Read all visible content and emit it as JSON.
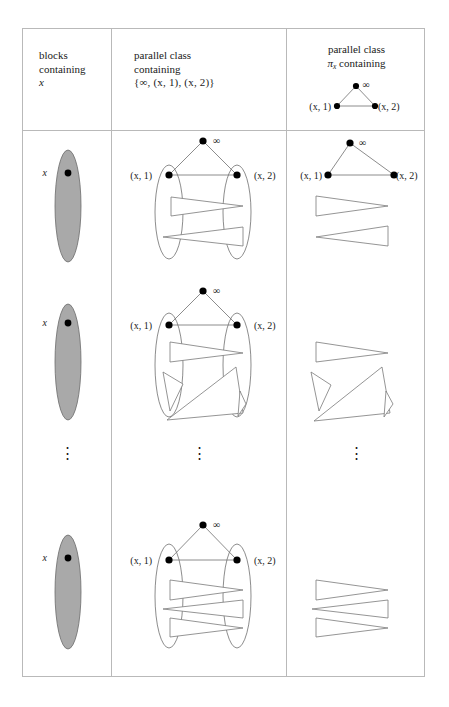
{
  "figure": {
    "columns": [
      {
        "id": "blocks",
        "header_lines": [
          "blocks",
          "containing",
          "x"
        ]
      },
      {
        "id": "parallel-class",
        "header_lines": [
          "parallel class",
          "containing",
          "{∞, (x, 1), (x, 2)}"
        ]
      },
      {
        "id": "parallel-class-pi-x",
        "header_lines": [
          "parallel class",
          "πx containing"
        ],
        "header_graph": {
          "top_label": "∞",
          "left_label": "(x, 1)",
          "right_label": "(x, 2)"
        }
      }
    ],
    "labels": {
      "point_x": "x",
      "left_node": "(x, 1)",
      "right_node": "(x, 2)",
      "infinity": "∞",
      "pi_symbol": "π",
      "pi_subscript": "x",
      "vertical_dots": "⋮",
      "set_notation": "{∞, (x, 1), (x, 2)}"
    },
    "rows": [
      {
        "id": "row-1",
        "wedge_count": 2
      },
      {
        "id": "row-2",
        "wedge_count": 3
      },
      {
        "id": "row-ellipsis",
        "wedge_count": 0
      },
      {
        "id": "row-3",
        "wedge_count": 3
      }
    ],
    "colors": {
      "block_fill": "#a9a9a9",
      "block_stroke": "#6b6b6b",
      "line": "#6f6f6f",
      "node": "#000000",
      "table_border": "#b9b9b9",
      "text": "#1a1a1a",
      "wedge_fill": "#ffffff",
      "wedge_stroke": "#7a7a7a",
      "background": "#ffffff"
    }
  }
}
